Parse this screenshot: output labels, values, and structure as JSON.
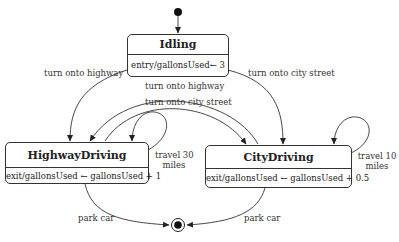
{
  "diagram": {
    "type": "UML state machine",
    "states": [
      {
        "id": "idling",
        "name": "Idling",
        "activity": "entry/gallonsUsed← 3"
      },
      {
        "id": "highway",
        "name": "HighwayDriving",
        "activity": "exit/gallonsUsed ← gallonsUsed + 1"
      },
      {
        "id": "city",
        "name": "CityDriving",
        "activity": "exit/gallonsUsed ← gallonsUsed + 0.5"
      }
    ],
    "transitions": [
      {
        "from": "initial",
        "to": "idling",
        "label": ""
      },
      {
        "from": "idling",
        "to": "highway",
        "label": "turn onto highway"
      },
      {
        "from": "idling",
        "to": "city",
        "label": "turn onto city street"
      },
      {
        "from": "city",
        "to": "highway",
        "label": "turn onto highway"
      },
      {
        "from": "highway",
        "to": "city",
        "label": "turn onto city street"
      },
      {
        "from": "highway",
        "to": "highway",
        "label": "travel 30 miles",
        "label_line1": "travel 30",
        "label_line2": "miles"
      },
      {
        "from": "city",
        "to": "city",
        "label": "travel 10 miles",
        "label_line1": "travel 10",
        "label_line2": "miles"
      },
      {
        "from": "highway",
        "to": "final",
        "label": "park car"
      },
      {
        "from": "city",
        "to": "final",
        "label": "park car"
      }
    ]
  }
}
